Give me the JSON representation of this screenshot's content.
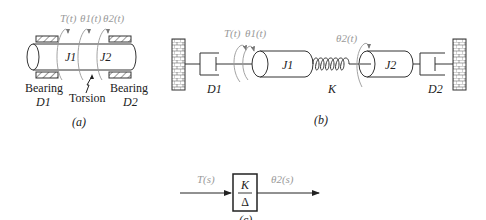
{
  "figure": {
    "panels": {
      "a": {
        "caption": "(a)",
        "torque_label": "T(t)",
        "theta1_label": "θ1(t)",
        "theta2_label": "θ2(t)",
        "j1_label": "J1",
        "j2_label": "J2",
        "bearing_left_label": "Bearing",
        "bearing_left_sub": "D1",
        "bearing_right_label": "Bearing",
        "bearing_right_sub": "D2",
        "torsion_label": "Torsion"
      },
      "b": {
        "caption": "(b)",
        "torque_label": "T(t)",
        "theta1_label": "θ1(t)",
        "theta2_label": "θ2(t)",
        "j1_label": "J1",
        "j2_label": "J2",
        "spring_label": "K",
        "damper_left_label": "D1",
        "damper_right_label": "D2"
      },
      "c": {
        "caption": "(c)",
        "input_label": "T(s)",
        "output_label": "θ2(s)",
        "block_numerator": "K",
        "block_denominator": "Δ"
      }
    },
    "colors": {
      "line": "#333333",
      "signal_label": "#9a9a9a",
      "text": "#222222"
    }
  }
}
